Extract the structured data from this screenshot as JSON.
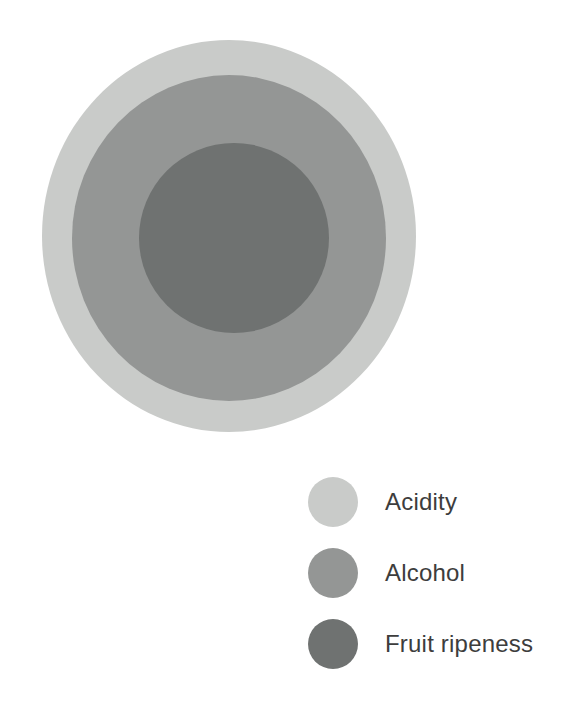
{
  "chart_data": {
    "type": "bubble",
    "title": "",
    "subtitle": "",
    "xlabel": "",
    "ylabel": "",
    "grid": false,
    "legend_position": "bottom-right",
    "categories": [
      "Acidity",
      "Alcohol",
      "Fruit ripeness"
    ],
    "series": [
      {
        "name": "Nested circle radii (px)",
        "values": [
          190,
          158,
          95
        ]
      }
    ],
    "circles": [
      {
        "label": "Acidity",
        "color": "#c9cbc9",
        "cx": 229,
        "cy": 236,
        "rx": 187,
        "ry": 196,
        "relative_size": 1.0
      },
      {
        "label": "Alcohol",
        "color": "#949695",
        "cx": 229,
        "cy": 238,
        "rx": 157,
        "ry": 163,
        "relative_size": 0.83
      },
      {
        "label": "Fruit ripeness",
        "color": "#6f7271",
        "cx": 234,
        "cy": 238,
        "rx": 95,
        "ry": 95,
        "relative_size": 0.5
      }
    ],
    "legend": [
      {
        "label": "Acidity",
        "color": "#c9cbc9"
      },
      {
        "label": "Alcohol",
        "color": "#949695"
      },
      {
        "label": "Fruit ripeness",
        "color": "#6f7271"
      }
    ],
    "colors": {
      "acidity": "#c9cbc9",
      "alcohol": "#949695",
      "fruit_ripeness": "#6f7271",
      "text": "#3d3d3d",
      "background": "#ffffff"
    }
  }
}
